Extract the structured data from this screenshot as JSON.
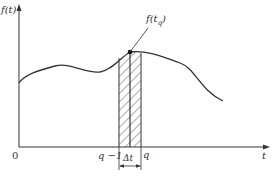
{
  "figure": {
    "y_axis_label": "f(t)",
    "x_axis_label": "t",
    "origin_label": "0",
    "point_label_main": "f(t",
    "point_label_sub": "q",
    "point_label_close": ")",
    "tick_left_label": "q −1",
    "tick_right_label": "q",
    "interval_label": "Δt",
    "colors": {
      "line": "#333333",
      "hatch": "#555555",
      "background": "#ffffff"
    }
  }
}
